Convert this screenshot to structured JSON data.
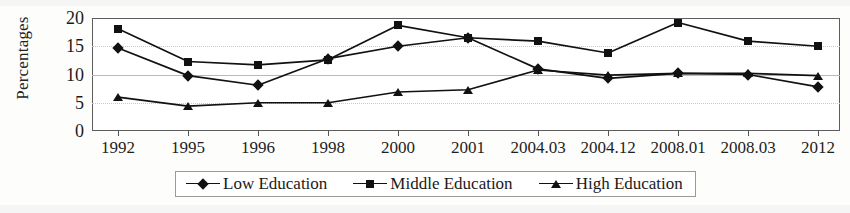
{
  "chart_data": {
    "type": "line",
    "title": "",
    "xlabel": "",
    "ylabel": "Percentages",
    "ylim": [
      0,
      20
    ],
    "yticks": [
      0,
      5,
      10,
      15,
      20
    ],
    "grid": true,
    "legend_position": "bottom",
    "categories": [
      "1992",
      "1995",
      "1996",
      "1998",
      "2000",
      "2001",
      "2004.03",
      "2004.12",
      "2008.01",
      "2008.03",
      "2012"
    ],
    "series": [
      {
        "name": "Low Education",
        "marker": "diamond",
        "values": [
          14.7,
          9.8,
          8.1,
          12.8,
          15.0,
          16.5,
          11.0,
          9.3,
          10.2,
          10.0,
          7.8
        ]
      },
      {
        "name": "Middle Education",
        "marker": "square",
        "values": [
          18.1,
          12.3,
          11.7,
          12.6,
          18.7,
          16.5,
          15.9,
          13.8,
          19.2,
          15.9,
          15.0
        ]
      },
      {
        "name": "High Education",
        "marker": "triangle",
        "values": [
          6.0,
          4.4,
          5.0,
          5.0,
          6.9,
          7.3,
          10.8,
          9.9,
          10.2,
          10.2,
          9.8
        ]
      }
    ]
  },
  "axis": {
    "y_title": "Percentages",
    "y_tick_labels": [
      "20",
      "15",
      "10",
      "5",
      "0"
    ],
    "x_tick_labels": [
      "1992",
      "1995",
      "1996",
      "1998",
      "2000",
      "2001",
      "2004.03",
      "2004.12",
      "2008.01",
      "2008.03",
      "2012"
    ]
  },
  "legend": {
    "items": [
      {
        "label": "Low Education",
        "marker": "diamond"
      },
      {
        "label": "Middle Education",
        "marker": "square"
      },
      {
        "label": "High Education",
        "marker": "triangle"
      }
    ]
  },
  "colors": {
    "series_ink": "#111111",
    "frame": "#5d5d5d",
    "grid": "#b9b9b9",
    "background": "#ffffff"
  }
}
